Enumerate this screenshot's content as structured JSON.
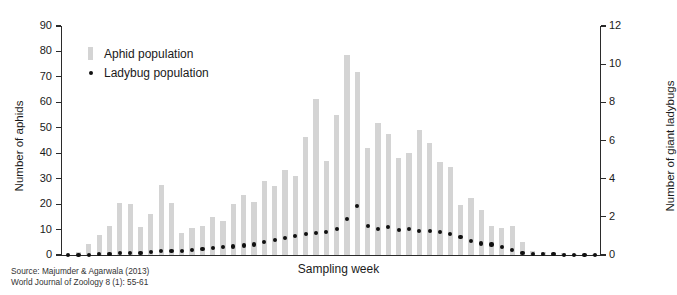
{
  "figure": {
    "source_line_1": "Source: Majumder & Agarwala (2013)",
    "source_line_2": "World Journal of Zoology 8 (1): 55-61"
  },
  "legend": {
    "position": "top-left-inside",
    "entries": [
      {
        "label": "Aphid population",
        "marker": "bar",
        "color": "#d4d4d4"
      },
      {
        "label": "Ladybug population",
        "marker": "dot",
        "color": "#111111"
      }
    ]
  },
  "chart_data": {
    "type": "bar",
    "title": "",
    "subtitle": "",
    "xlabel": "Sampling week",
    "ylabel": "Number of aphids",
    "y2label": "Number of giant ladybugs",
    "grid": false,
    "ylim": [
      0,
      90
    ],
    "y2lim": [
      0,
      12
    ],
    "yticks": [
      0,
      10,
      20,
      30,
      40,
      50,
      60,
      70,
      80,
      90
    ],
    "y2ticks": [
      0,
      2,
      4,
      6,
      8,
      10,
      12
    ],
    "xticks": [],
    "x": [
      1,
      2,
      3,
      4,
      5,
      6,
      7,
      8,
      9,
      10,
      11,
      12,
      13,
      14,
      15,
      16,
      17,
      18,
      19,
      20,
      21,
      22,
      23,
      24,
      25,
      26,
      27,
      28,
      29,
      30,
      31,
      32,
      33,
      34,
      35,
      36,
      37,
      38,
      39,
      40,
      41,
      42,
      43,
      44,
      45,
      46,
      47,
      48,
      49,
      50,
      51,
      52
    ],
    "series": [
      {
        "name": "Aphid population",
        "axis": "left",
        "marker": "bar",
        "color": "#d4d4d4",
        "values": [
          0,
          1,
          4.5,
          8,
          11.5,
          20.5,
          20,
          11,
          16,
          27.5,
          20.5,
          8.5,
          10.5,
          11.5,
          15,
          13.5,
          20,
          23.5,
          21,
          29,
          27,
          33.5,
          31,
          46.5,
          61.5,
          37,
          55,
          78.5,
          72,
          42,
          52,
          47.5,
          38,
          40,
          49,
          44,
          36.5,
          34.5,
          19.5,
          22.5,
          17.5,
          11.5,
          10.5,
          11.5,
          5,
          1.5,
          1,
          0.8,
          0.6,
          0.5,
          0.4,
          0.3
        ]
      },
      {
        "name": "Ladybug population",
        "axis": "right",
        "marker": "dot",
        "color": "#111111",
        "values": [
          0.0,
          0.0,
          0.0,
          0.05,
          0.05,
          0.1,
          0.1,
          0.1,
          0.15,
          0.2,
          0.2,
          0.2,
          0.25,
          0.3,
          0.35,
          0.4,
          0.45,
          0.5,
          0.55,
          0.7,
          0.8,
          0.9,
          1.0,
          1.1,
          1.15,
          1.2,
          1.35,
          1.9,
          2.55,
          1.5,
          1.35,
          1.45,
          1.3,
          1.35,
          1.25,
          1.25,
          1.2,
          1.1,
          0.95,
          0.75,
          0.6,
          0.55,
          0.4,
          0.25,
          0.1,
          0.05,
          0.05,
          0.05,
          0.02,
          0.02,
          0.02,
          0.02
        ]
      }
    ]
  }
}
